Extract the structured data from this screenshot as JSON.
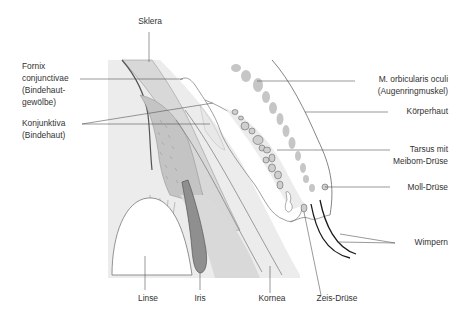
{
  "diagram": {
    "type": "anatomical-cross-section",
    "colors": {
      "background": "#ffffff",
      "light_gray_region": "#ebebeb",
      "sclera_band": "#d6d6d6",
      "ciliary_body": "#bdbdbd",
      "iris": "#8f8f8f",
      "muscle_blobs": "#c8c8c8",
      "meibom_glands": "#cfcfcf",
      "lashes": "#1a1a1a",
      "leader_lines": "#555555",
      "text": "#333333"
    }
  },
  "labels": {
    "sklera": "Sklera",
    "fornix_line1": "Fornix",
    "fornix_line2": "conjunctivae",
    "fornix_line3": "(Bindehaut-",
    "fornix_line4": "gewölbe)",
    "konjunktiva_line1": "Konjunktiva",
    "konjunktiva_line2": "(Bindehaut)",
    "orbicularis_line1": "M. orbicularis oculi",
    "orbicularis_line2": "(Augenringmuskel)",
    "koerperhaut": "Körperhaut",
    "tarsus_line1": "Tarsus mit",
    "tarsus_line2": "Meibom-Drüse",
    "moll": "Moll-Drüse",
    "wimpern": "Wimpern",
    "linse": "Linse",
    "iris": "Iris",
    "kornea": "Kornea",
    "zeis": "Zeis-Drüse"
  }
}
